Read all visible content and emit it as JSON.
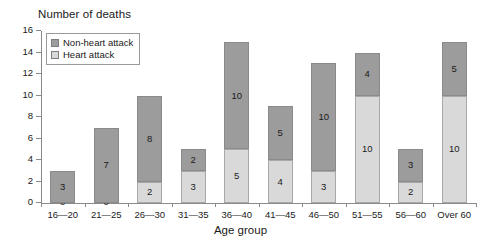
{
  "chart_data": {
    "type": "bar",
    "subtype": "stacked-bar",
    "title": "",
    "ylabel": "Number of deaths",
    "xlabel": "Age group",
    "ylim": [
      0,
      16
    ],
    "yticks": [
      0,
      2,
      4,
      6,
      8,
      10,
      12,
      14,
      16
    ],
    "grid": false,
    "legend_position": "top-left-inside",
    "categories": [
      "16—20",
      "21—25",
      "26—30",
      "31—35",
      "36—40",
      "41—45",
      "46—50",
      "51—55",
      "56—60",
      "Over 60"
    ],
    "series": [
      {
        "name": "Heart attack",
        "color": "#d9d9d9",
        "values": [
          0,
          0,
          2,
          3,
          5,
          4,
          3,
          10,
          2,
          10
        ]
      },
      {
        "name": "Non-heart attack",
        "color": "#9c9c9c",
        "values": [
          3,
          7,
          8,
          2,
          10,
          5,
          10,
          4,
          3,
          5
        ]
      }
    ],
    "stack_order_bottom_to_top": [
      "Heart attack",
      "Non-heart attack"
    ],
    "totals": [
      3,
      7,
      10,
      5,
      15,
      9,
      13,
      14,
      5,
      15
    ]
  },
  "legend": {
    "items": [
      {
        "label": "Non-heart attack",
        "color": "#9c9c9c"
      },
      {
        "label": "Heart attack",
        "color": "#d9d9d9"
      }
    ]
  },
  "axes": {
    "y_title": "Number of deaths",
    "x_title": "Age group"
  }
}
